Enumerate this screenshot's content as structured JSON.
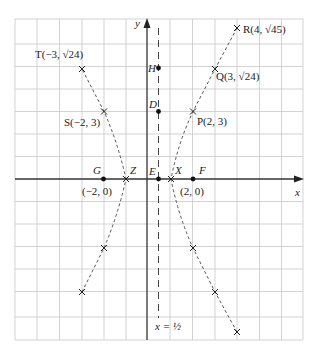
{
  "diagram": {
    "type": "hyperbola-plot",
    "axes": {
      "x_label": "x",
      "y_label": "y",
      "grid_unit": 1,
      "x_range": [
        -6,
        7
      ],
      "y_range": [
        -7,
        7
      ]
    },
    "asymptote": {
      "label": "x = ½",
      "x": 0.5
    },
    "points": [
      {
        "id": "T",
        "label": "T(−3, √24)",
        "x": -3,
        "y": 4.899,
        "marker": "cross"
      },
      {
        "id": "R",
        "label": "R(4, √45)",
        "x": 4,
        "y": 6.708,
        "marker": "cross"
      },
      {
        "id": "Q",
        "label": "Q(3, √24)",
        "x": 3,
        "y": 4.899,
        "marker": "cross"
      },
      {
        "id": "S",
        "label": "S(−2, 3)",
        "x": -2,
        "y": 3,
        "marker": "cross"
      },
      {
        "id": "P",
        "label": "P(2, 3)",
        "x": 2,
        "y": 3,
        "marker": "cross"
      },
      {
        "id": "H",
        "label": "H",
        "x": 0.5,
        "y": 5,
        "marker": "dot"
      },
      {
        "id": "D",
        "label": "D",
        "x": 0.5,
        "y": 3,
        "marker": "dot"
      },
      {
        "id": "E",
        "label": "E",
        "x": 0.5,
        "y": 0,
        "marker": "dot"
      },
      {
        "id": "G",
        "label": "G",
        "x": -2,
        "y": 0,
        "marker": "dot"
      },
      {
        "id": "F",
        "label": "F",
        "x": 2,
        "y": 0,
        "marker": "dot"
      },
      {
        "id": "Z",
        "label": "Z",
        "x": -1,
        "y": 0,
        "marker": "cross"
      },
      {
        "id": "X",
        "label": "X",
        "x": 1,
        "y": 0,
        "marker": "cross"
      }
    ],
    "coord_labels": {
      "G": "(−2, 0)",
      "F": "(2, 0)"
    },
    "lower_points": [
      {
        "x": -2,
        "y": -3
      },
      {
        "x": -3,
        "y": -4.899
      },
      {
        "x": 2,
        "y": -3
      },
      {
        "x": 3,
        "y": -4.899
      },
      {
        "x": 4,
        "y": -6.708
      }
    ]
  }
}
